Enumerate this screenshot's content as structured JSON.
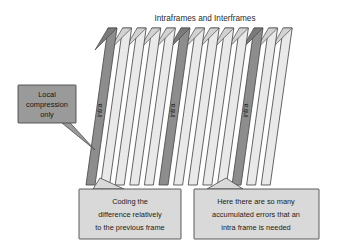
{
  "canvas": {
    "width": 344,
    "height": 247,
    "background": "#ffffff"
  },
  "title": {
    "text": "Intraframes and Interframes",
    "x": 205,
    "y": 21
  },
  "colors": {
    "frame_light_fill": "#e9e9e9",
    "frame_light_top": "#d2d2d2",
    "frame_dark_fill": "#8d8d8d",
    "frame_dark_top": "#7a7a7a",
    "stroke": "#4a4a4a",
    "callout_dark_fill": "#9a9a9a",
    "callout_light_fill": "#d9d9d9",
    "text": "#1c1c1c"
  },
  "frames": {
    "count": 13,
    "label": "intra",
    "spacing": 14.6,
    "start_x": 86,
    "top_y": 28,
    "bottom_y": 185,
    "slant": 22,
    "width": 9,
    "intra_indices": [
      0,
      5,
      10
    ],
    "items": [
      {
        "index": 0,
        "type": "intra",
        "label": "intra"
      },
      {
        "index": 1,
        "type": "inter",
        "label": ""
      },
      {
        "index": 2,
        "type": "inter",
        "label": ""
      },
      {
        "index": 3,
        "type": "inter",
        "label": ""
      },
      {
        "index": 4,
        "type": "inter",
        "label": ""
      },
      {
        "index": 5,
        "type": "intra",
        "label": "intra"
      },
      {
        "index": 6,
        "type": "inter",
        "label": ""
      },
      {
        "index": 7,
        "type": "inter",
        "label": ""
      },
      {
        "index": 8,
        "type": "inter",
        "label": ""
      },
      {
        "index": 9,
        "type": "inter",
        "label": ""
      },
      {
        "index": 10,
        "type": "intra",
        "label": "intra"
      },
      {
        "index": 11,
        "type": "inter",
        "label": ""
      },
      {
        "index": 12,
        "type": "inter",
        "label": ""
      }
    ]
  },
  "callouts": {
    "local": {
      "lines": [
        "Local",
        "compression",
        "only"
      ],
      "line1": "Local",
      "line2": "compression",
      "line3": "only",
      "x": 18,
      "y": 85,
      "width": 58,
      "height": 38,
      "fill": "#9a9a9a"
    },
    "coding": {
      "lines": [
        "Coding the",
        "difference relatively",
        "to the previous frame"
      ],
      "line1": "Coding the",
      "line2": "difference relatively",
      "line3": "to the previous frame",
      "x": 79,
      "y": 189,
      "width": 102,
      "height": 50,
      "fill": "#d9d9d9"
    },
    "errors": {
      "lines": [
        "Here there are so many",
        "accumulated errors that an",
        "intra frame is needed"
      ],
      "line1": "Here there are so many",
      "line2": "accumulated errors that an",
      "line3": "intra frame is needed",
      "x": 194,
      "y": 189,
      "width": 125,
      "height": 50,
      "fill": "#d9d9d9"
    }
  }
}
